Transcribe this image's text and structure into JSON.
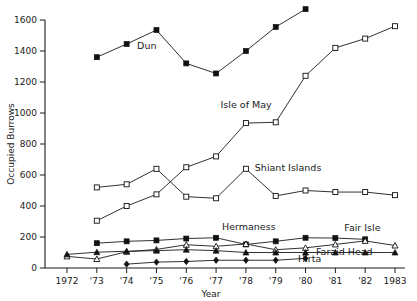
{
  "chart_data": {
    "type": "line",
    "title": "",
    "xlabel": "Year",
    "ylabel": "Occupied Burrows",
    "x": [
      1972,
      1973,
      1974,
      1975,
      1976,
      1977,
      1978,
      1979,
      1980,
      1981,
      1982,
      1983
    ],
    "xticklabels": [
      "1972",
      "'73",
      "'74",
      "'75",
      "'76",
      "'77",
      "'78",
      "'79",
      "'80",
      "'81",
      "'82",
      "1983"
    ],
    "yticklabels": [
      "0",
      "200",
      "400",
      "600",
      "800",
      "1000",
      "1200",
      "1400",
      "1600"
    ],
    "yticks": [
      0,
      200,
      400,
      600,
      800,
      1000,
      1200,
      1400,
      1600
    ],
    "ylim": [
      0,
      1600
    ],
    "xlim": [
      1972,
      1983
    ],
    "grid": false,
    "legend": "inline-labels",
    "series": [
      {
        "name": "Dun",
        "marker": "filled-square",
        "label_x": 1974.35,
        "label_y": 1415,
        "x": [
          1973,
          1974,
          1975,
          1976,
          1977,
          1978,
          1979,
          1980
        ],
        "values": [
          1360,
          1445,
          1535,
          1320,
          1255,
          1400,
          1555,
          1670
        ]
      },
      {
        "name": "Isle of May",
        "marker": "open-square",
        "label_x": 1977.15,
        "label_y": 1030,
        "x": [
          1973,
          1974,
          1975,
          1976,
          1977,
          1978,
          1979,
          1980,
          1981,
          1982,
          1983
        ],
        "values": [
          305,
          400,
          475,
          650,
          720,
          935,
          940,
          1240,
          1420,
          1480,
          1560
        ]
      },
      {
        "name": "Shiant Islands",
        "marker": "open-square",
        "label_x": 1978.3,
        "label_y": 625,
        "x": [
          1973,
          1974,
          1975,
          1976,
          1977,
          1978,
          1979,
          1980,
          1981,
          1982,
          1983
        ],
        "values": [
          520,
          540,
          640,
          460,
          450,
          640,
          465,
          500,
          490,
          490,
          470
        ]
      },
      {
        "name": "Hermaness",
        "marker": "filled-square",
        "label_x": 1977.2,
        "label_y": 248,
        "x": [
          1973,
          1974,
          1975,
          1976,
          1977,
          1978,
          1979,
          1980,
          1981,
          1982
        ],
        "values": [
          160,
          172,
          178,
          190,
          195,
          152,
          172,
          195,
          193,
          185
        ]
      },
      {
        "name": "Fair Isle",
        "marker": "open-triangle",
        "label_x": 1981.3,
        "label_y": 240,
        "x": [
          1972,
          1973,
          1974,
          1975,
          1976,
          1977,
          1978,
          1979,
          1980,
          1981,
          1982,
          1983
        ],
        "values": [
          75,
          58,
          105,
          120,
          150,
          140,
          155,
          118,
          130,
          152,
          175,
          145
        ]
      },
      {
        "name": "Faraid Head",
        "marker": "filled-triangle",
        "label_x": 1980.35,
        "label_y": 85,
        "x": [
          1972,
          1973,
          1974,
          1975,
          1976,
          1977,
          1978,
          1979,
          1980,
          1981,
          1982,
          1983
        ],
        "values": [
          88,
          102,
          108,
          112,
          118,
          112,
          100,
          100,
          100,
          100,
          100,
          100
        ]
      },
      {
        "name": "Hirta",
        "marker": "filled-diamond",
        "label_x": 1979.75,
        "label_y": 40,
        "x": [
          1974,
          1975,
          1976,
          1977,
          1978,
          1979,
          1980
        ],
        "values": [
          25,
          38,
          42,
          50,
          50,
          50,
          62
        ]
      }
    ]
  }
}
